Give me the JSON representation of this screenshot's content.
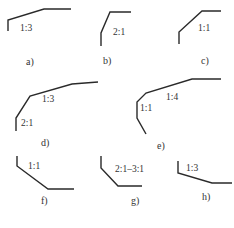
{
  "diagram": {
    "type": "slope-profiles",
    "line_color": "#2a2a2a",
    "text_color": "#333333",
    "figures": [
      {
        "id": "a",
        "caption": "a)",
        "points": "8,31 8,20 44,9 71,9",
        "labels": [
          {
            "text": "1:3",
            "x": 20,
            "y": 31
          }
        ],
        "caption_pos": {
          "x": 26,
          "y": 65
        }
      },
      {
        "id": "b",
        "caption": "b)",
        "points": "101,46 101,33 110,12 131,12",
        "labels": [
          {
            "text": "2:1",
            "x": 113,
            "y": 35
          }
        ],
        "caption_pos": {
          "x": 103,
          "y": 64
        }
      },
      {
        "id": "c",
        "caption": "c)",
        "points": "179,44 179,32 202,11 221,11",
        "labels": [
          {
            "text": "1:1",
            "x": 198,
            "y": 31
          }
        ],
        "caption_pos": {
          "x": 201,
          "y": 64
        }
      },
      {
        "id": "d",
        "caption": "d)",
        "points": "16,131 16,118 30,96 72,84 98,82",
        "labels": [
          {
            "text": "1:3",
            "x": 42,
            "y": 102
          },
          {
            "text": "2:1",
            "x": 21,
            "y": 126
          }
        ],
        "caption_pos": {
          "x": 41,
          "y": 146
        }
      },
      {
        "id": "e",
        "caption": "e)",
        "points": "146,134 137,118 137,102 146,93 192,79 221,79",
        "labels": [
          {
            "text": "1:4",
            "x": 166,
            "y": 100
          },
          {
            "text": "1:1",
            "x": 140,
            "y": 111
          }
        ],
        "caption_pos": {
          "x": 157,
          "y": 149
        }
      },
      {
        "id": "f",
        "caption": "f)",
        "points": "17,156 17,166 48,189 74,189",
        "labels": [
          {
            "text": "1:1",
            "x": 28,
            "y": 169
          }
        ],
        "caption_pos": {
          "x": 41,
          "y": 204
        }
      },
      {
        "id": "g",
        "caption": "g)",
        "points": "101,156 101,168 118,186 142,186",
        "labels": [
          {
            "text": "2:1–3:1",
            "x": 115,
            "y": 172
          }
        ],
        "caption_pos": {
          "x": 131,
          "y": 204
        }
      },
      {
        "id": "h",
        "caption": "h)",
        "points": "178,161 178,173 212,183 232,183",
        "labels": [
          {
            "text": "1:3",
            "x": 186,
            "y": 171
          }
        ],
        "caption_pos": {
          "x": 202,
          "y": 200
        }
      }
    ]
  }
}
